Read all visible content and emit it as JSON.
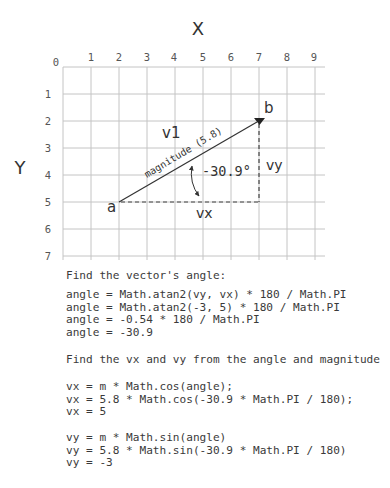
{
  "diagram": {
    "x_axis_label": "X",
    "y_axis_label": "Y",
    "origin_label": "0",
    "x_ticks": [
      "1",
      "2",
      "3",
      "4",
      "5",
      "6",
      "7",
      "8",
      "9"
    ],
    "y_ticks": [
      "1",
      "2",
      "3",
      "4",
      "5",
      "6",
      "7"
    ],
    "point_a": {
      "label": "a",
      "x": 2,
      "y": 5
    },
    "point_b": {
      "label": "b",
      "x": 7,
      "y": 2
    },
    "vector_label": "v1",
    "magnitude_label": "magnitude (5.8)",
    "angle_label": "-30.9°",
    "vx_label": "vx",
    "vy_label": "vy"
  },
  "explanation": {
    "angle_heading": "Find the vector's angle:",
    "angle_lines": [
      "angle = Math.atan2(vy, vx) * 180 / Math.PI",
      "angle = Math.atan2(-3, 5) * 180 / Math.PI",
      "angle = -0.54 * 180 / Math.PI",
      "angle = -30.9"
    ],
    "components_heading": "Find the vx and vy from the angle and magnitude",
    "vx_lines": [
      "vx = m * Math.cos(angle);",
      "vx = 5.8 * Math.cos(-30.9 * Math.PI / 180);",
      "vx = 5"
    ],
    "vy_lines": [
      "vy = m * Math.sin(angle)",
      "vy = 5.8 * Math.sin(-30.9 * Math.PI / 180)",
      "vy = -3"
    ]
  },
  "colors": {
    "grid": "#c4c4c4",
    "text": "#3a3a3a",
    "vector": "#333333"
  }
}
